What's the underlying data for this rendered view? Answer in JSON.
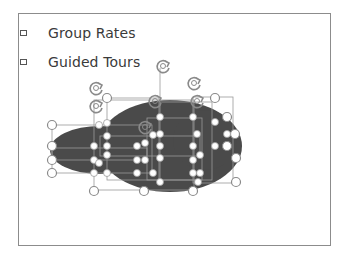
{
  "slide": {
    "bullets": [
      {
        "label": "Group Rates",
        "icon": "square-bullet-icon"
      },
      {
        "label": "Guided Tours",
        "icon": "square-bullet-icon"
      }
    ]
  },
  "selection": {
    "shape": "cloud-of-ellipses",
    "fill_color": "#4a4a4a",
    "handle_color": "#8a8a8a",
    "handle_fill": "#ffffff",
    "rotate_handle_icon": "rotate-icon"
  },
  "colors": {
    "slide_border": "#8c8c8c",
    "text": "#3a3a3a",
    "background": "#ffffff"
  }
}
